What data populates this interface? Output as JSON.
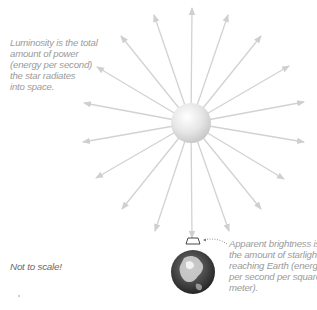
{
  "diagram": {
    "colors": {
      "arrow": "#cfcfcf",
      "star_light": "#fbfbfb",
      "star_dark": "#c9c9c9",
      "caption_text": "#9a9a9a",
      "note_text": "#6a6a6a",
      "earth_dark": "#2a2a2a"
    },
    "star": {
      "label": "star",
      "cx": 191,
      "cy": 123,
      "r": 20
    },
    "earth": {
      "label": "Earth",
      "cx": 193,
      "cy": 272,
      "r": 22
    },
    "arrow_count": 20,
    "luminosity_caption": {
      "lines": [
        "Luminosity is the total",
        "amount of power",
        "(energy per second)",
        "the star radiates",
        "into space."
      ]
    },
    "scale_note": "Not to scale!",
    "brightness_caption": {
      "lines": [
        "Apparent brightness is",
        "the amount of starlight",
        "reaching Earth (energy",
        "per second per square",
        "meter)."
      ]
    }
  }
}
